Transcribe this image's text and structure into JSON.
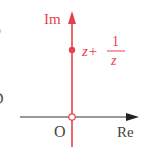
{
  "diagram": {
    "type": "complex-plane",
    "colors": {
      "imaginary_axis": "#e8414d",
      "real_axis": "#333333",
      "label_red": "#e8414d",
      "label_dark": "#444444"
    },
    "axes": {
      "imaginary_label": "Im",
      "real_label": "Re",
      "origin_label": "O"
    },
    "point": {
      "label_prefix": "z+",
      "fraction_numerator": "1",
      "fraction_denominator": "z"
    },
    "left_edge_fragments": [
      "P",
      "D"
    ]
  }
}
